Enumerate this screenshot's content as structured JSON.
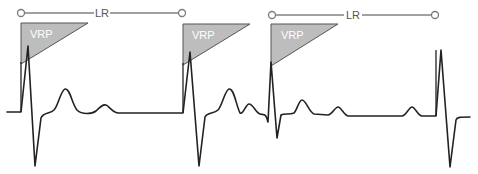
{
  "diagram": {
    "colors": {
      "trace": "#222222",
      "vrp_fill": "#bdbdbd",
      "lr_line": "#7a7a7a",
      "background": "#ffffff"
    },
    "lr_intervals": [
      {
        "label": "LR",
        "x_start": 21,
        "x_end": 182,
        "y": 13
      },
      {
        "label": "LR",
        "x_start": 271,
        "x_end": 435,
        "y": 15
      }
    ],
    "vrp_windows": [
      {
        "label": "VRP",
        "x_start": 21,
        "x_end": 88,
        "y_top": 23,
        "y_bottom": 64
      },
      {
        "label": "VRP",
        "x_start": 183,
        "x_end": 250,
        "y_top": 24,
        "y_bottom": 65
      },
      {
        "label": "VRP",
        "x_start": 271,
        "x_end": 338,
        "y_top": 24,
        "y_bottom": 66
      }
    ],
    "beats": [
      {
        "type": "paced",
        "spike_x": 21
      },
      {
        "type": "paced",
        "spike_x": 183
      },
      {
        "type": "intrinsic",
        "r_x": 271
      },
      {
        "type": "paced",
        "spike_x": 436
      }
    ]
  }
}
